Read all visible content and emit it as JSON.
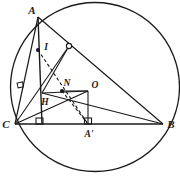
{
  "figure": {
    "caption": "",
    "stroke_color": "#1a1a1a",
    "background_color": "#ffffff"
  },
  "circle": {
    "name": "circumcircle",
    "center_x": 95,
    "center_y": 87,
    "radius": 84.5
  },
  "points": [
    {
      "id": "A",
      "label": "A",
      "x": 38,
      "y": 17,
      "label_x": 32,
      "label_y": 12,
      "marker": "none",
      "role": "triangle-vertex"
    },
    {
      "id": "B",
      "label": "B",
      "x": 163,
      "y": 124,
      "label_x": 168,
      "label_y": 128,
      "marker": "none",
      "role": "triangle-vertex"
    },
    {
      "id": "C",
      "label": "C",
      "x": 15,
      "y": 124,
      "label_x": 4,
      "label_y": 128,
      "marker": "none",
      "role": "triangle-vertex"
    },
    {
      "id": "H",
      "label": "H",
      "x": 42,
      "y": 93,
      "label_x": 43,
      "label_y": 104,
      "marker": "none",
      "role": "orthocenter"
    },
    {
      "id": "I",
      "label": "I",
      "x": 38,
      "y": 50,
      "label_x": 45,
      "label_y": 49,
      "marker": "filled",
      "role": "incenter"
    },
    {
      "id": "N",
      "label": "N",
      "x": 62,
      "y": 91,
      "label_x": 64,
      "label_y": 86,
      "marker": "filled",
      "role": "nine-point-center"
    },
    {
      "id": "O",
      "label": "O",
      "x": 88,
      "y": 91,
      "label_x": 92,
      "label_y": 88,
      "marker": "none",
      "role": "circumcenter"
    },
    {
      "id": "Ap",
      "label": "A'",
      "x": 88,
      "y": 124,
      "label_x": 84,
      "label_y": 136,
      "marker": "none",
      "role": "foot-of-altitude-from-A"
    },
    {
      "id": "M",
      "label": "",
      "x": 69,
      "y": 46,
      "label_x": 0,
      "label_y": 0,
      "marker": "hollow",
      "role": "midpoint-of-AB"
    }
  ],
  "segments": [
    {
      "name": "side-AB",
      "from": "A",
      "to": "B",
      "style": "solid"
    },
    {
      "name": "side-BC",
      "from": "B",
      "to": "C",
      "style": "solid"
    },
    {
      "name": "side-CA",
      "from": "C",
      "to": "A",
      "style": "solid"
    },
    {
      "name": "altitude-A-to-Ap",
      "from": "A",
      "to": "Ap",
      "style": "solid"
    },
    {
      "name": "segment-C-to-H",
      "from": "C",
      "to": "H",
      "style": "solid"
    },
    {
      "name": "segment-H-to-B",
      "from": "H",
      "to": "B",
      "style": "solid"
    },
    {
      "name": "segment-H-to-M",
      "from": "H",
      "to": "M",
      "style": "solid"
    },
    {
      "name": "segment-H-to-O",
      "from": "H",
      "to": "O",
      "style": "solid"
    },
    {
      "name": "segment-O-to-Ap",
      "from": "O",
      "to": "Ap",
      "style": "solid"
    },
    {
      "name": "segment-C-to-O",
      "from": "C",
      "to": "O",
      "style": "solid"
    },
    {
      "name": "segment-C-to-foot-on-CA",
      "from": "C",
      "to": "A",
      "style": "solid"
    },
    {
      "name": "dashed-A-to-incenter-extended",
      "from": "I",
      "to": "Ap",
      "style": "dashed"
    },
    {
      "name": "dashed-I-to-B",
      "from": "I",
      "to": "B",
      "style": "dashed"
    }
  ],
  "right_angle_marks": [
    {
      "name": "right-angle-at-Ap-left",
      "x": 39,
      "y": 118,
      "size": 6,
      "orientation": "up"
    },
    {
      "name": "right-angle-at-Ap",
      "x": 85,
      "y": 118,
      "size": 6,
      "orientation": "up"
    },
    {
      "name": "right-angle-on-side-CA",
      "x": 20,
      "y": 84,
      "size": 5,
      "orientation": "rotated"
    }
  ],
  "labels": {
    "A": "A",
    "B": "B",
    "C": "C",
    "H": "H",
    "I": "I",
    "N": "N",
    "O": "O",
    "A_prime": "A'"
  }
}
